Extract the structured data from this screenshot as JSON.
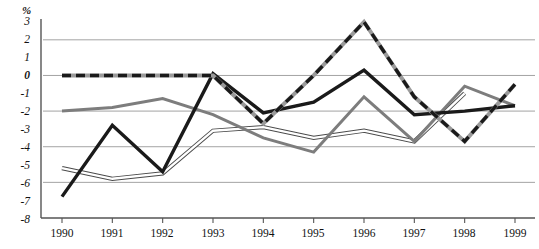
{
  "chart_data": {
    "type": "line",
    "title": "",
    "xlabel": "",
    "ylabel": "%",
    "unit_label": "%",
    "categories": [
      "1990",
      "1991",
      "1992",
      "1993",
      "1994",
      "1995",
      "1996",
      "1997",
      "1998",
      "1999"
    ],
    "x": [
      1990,
      1991,
      1992,
      1993,
      1994,
      1995,
      1996,
      1997,
      1998,
      1999
    ],
    "ylim": [
      -8,
      3
    ],
    "xlim": [
      1990,
      1999
    ],
    "yticks": [
      "3",
      "2",
      "1",
      "0",
      "-1",
      "-2",
      "-3",
      "-4",
      "-5",
      "-6",
      "-7",
      "-8"
    ],
    "ytick_values": [
      3,
      2,
      1,
      0,
      -1,
      -2,
      -3,
      -4,
      -5,
      -6,
      -7,
      -8
    ],
    "gridlines": [
      2,
      0,
      -2,
      -4,
      -6
    ],
    "grid": true,
    "legend": "none",
    "legend_position": "none",
    "series": [
      {
        "name": "dashed-black-white",
        "style": "dashed",
        "color": "#1a1a1a",
        "values": [
          0.0,
          0.0,
          0.0,
          0.0,
          -2.7,
          0.0,
          3.0,
          -1.2,
          -3.7,
          -0.5
        ]
      },
      {
        "name": "bold-black",
        "style": "solid-bold",
        "color": "#1a1a1a",
        "values": [
          -6.8,
          -2.8,
          -5.4,
          0.1,
          -2.1,
          -1.5,
          0.3,
          -2.2,
          -2.0,
          -1.7
        ]
      },
      {
        "name": "gray",
        "style": "solid",
        "color": "#7d7d7d",
        "values": [
          -2.0,
          -1.8,
          -1.3,
          -2.2,
          -3.5,
          -4.3,
          -1.2,
          -3.7,
          -0.6,
          -1.7
        ]
      },
      {
        "name": "outlined-double",
        "style": "outline",
        "color": "#b4b4b4",
        "values": [
          -5.2,
          -5.8,
          -5.5,
          -3.1,
          -2.9,
          -3.5,
          -3.1,
          -3.7,
          -1.0,
          null
        ]
      }
    ],
    "colors": {
      "axis": "#555555",
      "grid": "#999999",
      "dark": "#1a1a1a",
      "gray": "#7d7d7d",
      "light": "#b4b4b4",
      "background": "#ffffff"
    }
  },
  "axis": {
    "unit": "%",
    "y_labels": [
      "3",
      "2",
      "1",
      "0",
      "-1",
      "-2",
      "-3",
      "-4",
      "-5",
      "-6",
      "-7",
      "-8"
    ],
    "x_labels": [
      "1990",
      "1991",
      "1992",
      "1993",
      "1994",
      "1995",
      "1996",
      "1997",
      "1998",
      "1999"
    ]
  }
}
